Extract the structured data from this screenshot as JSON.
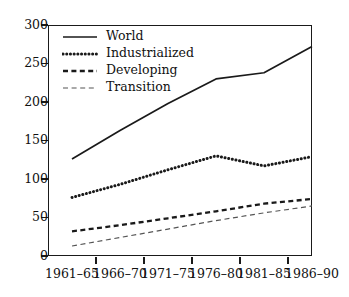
{
  "chart_data": {
    "type": "line",
    "title": "",
    "subtitle": "",
    "xlabel": "",
    "ylabel": "",
    "categories": [
      "1961–65",
      "1966–70",
      "1971–75",
      "1976–80",
      "1981–85",
      "1986–90"
    ],
    "ylim": [
      0,
      300
    ],
    "yticks": [
      "0",
      "50",
      "100",
      "150",
      "200",
      "250",
      "300"
    ],
    "ytick_values": [
      0,
      50,
      100,
      150,
      200,
      250,
      300
    ],
    "grid": false,
    "legend_position": "top-left",
    "series": [
      {
        "name": "World",
        "style": "solid",
        "color": "#1a1a1a",
        "values": [
          126,
          163,
          198,
          230,
          238,
          272
        ]
      },
      {
        "name": "Industrialized",
        "style": "dotted",
        "color": "#1a1a1a",
        "values": [
          76,
          93,
          112,
          130,
          117,
          129
        ]
      },
      {
        "name": "Developing",
        "style": "dashed",
        "color": "#1a1a1a",
        "values": [
          32,
          40,
          49,
          58,
          68,
          74
        ]
      },
      {
        "name": "Transition",
        "style": "thin-dashed",
        "color": "#555555",
        "values": [
          13,
          24,
          35,
          46,
          56,
          65
        ]
      }
    ]
  },
  "colors": {
    "axis": "#1a1a1a",
    "text": "#111111",
    "background": "#ffffff",
    "transition_line": "#555555"
  }
}
